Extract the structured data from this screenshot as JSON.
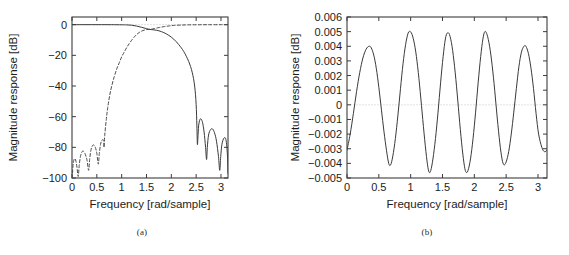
{
  "figure": {
    "panels": [
      {
        "id": "a",
        "caption": "(a)",
        "chart_data": {
          "type": "line",
          "title": "",
          "xlabel": "Frequency [rad/sample]",
          "ylabel": "Magnitude response [dB]",
          "xlim": [
            0,
            3.14159
          ],
          "ylim": [
            -100,
            5
          ],
          "xticks": [
            0,
            0.5,
            1,
            1.5,
            2,
            2.5,
            3
          ],
          "xticklabels": [
            "0",
            "0.5",
            "1",
            "1.5",
            "2",
            "2.5",
            "3"
          ],
          "yticks": [
            0,
            -20,
            -40,
            -60,
            -80,
            -100
          ],
          "yticklabels": [
            "0",
            "−20",
            "−40",
            "−60",
            "−80",
            "−100"
          ],
          "grid": false,
          "legend": "none",
          "reference_line": {
            "y": 0,
            "style": "dotted",
            "color": "#bfbfbf"
          },
          "series": [
            {
              "name": "lowpass-response",
              "style": "solid",
              "color": "#3a3a3a",
              "points": [
                [
                  0.0,
                  0.0
                ],
                [
                  0.2,
                  0.0
                ],
                [
                  0.4,
                  0.0
                ],
                [
                  0.6,
                  0.0
                ],
                [
                  0.8,
                  -0.02
                ],
                [
                  1.0,
                  -0.08
                ],
                [
                  1.1,
                  -0.15
                ],
                [
                  1.2,
                  -0.35
                ],
                [
                  1.3,
                  -0.9
                ],
                [
                  1.4,
                  -1.7
                ],
                [
                  1.5,
                  -2.6
                ],
                [
                  1.57,
                  -3.1
                ],
                [
                  1.65,
                  -3.4
                ],
                [
                  1.75,
                  -4.0
                ],
                [
                  1.85,
                  -5.2
                ],
                [
                  1.95,
                  -7.0
                ],
                [
                  2.05,
                  -9.5
                ],
                [
                  2.15,
                  -13.0
                ],
                [
                  2.25,
                  -17.5
                ],
                [
                  2.35,
                  -24.0
                ],
                [
                  2.42,
                  -31.0
                ],
                [
                  2.47,
                  -40.0
                ],
                [
                  2.5,
                  -52.0
                ],
                [
                  2.515,
                  -66.0
                ],
                [
                  2.525,
                  -78.0
                ],
                [
                  2.535,
                  -74.0
                ],
                [
                  2.55,
                  -66.0
                ],
                [
                  2.575,
                  -62.0
                ],
                [
                  2.6,
                  -61.5
                ],
                [
                  2.63,
                  -64.0
                ],
                [
                  2.66,
                  -70.0
                ],
                [
                  2.69,
                  -80.0
                ],
                [
                  2.71,
                  -88.0
                ],
                [
                  2.725,
                  -80.0
                ],
                [
                  2.75,
                  -72.0
                ],
                [
                  2.79,
                  -68.5
                ],
                [
                  2.83,
                  -68.0
                ],
                [
                  2.87,
                  -70.5
                ],
                [
                  2.91,
                  -76.0
                ],
                [
                  2.95,
                  -86.0
                ],
                [
                  2.975,
                  -95.0
                ],
                [
                  2.995,
                  -86.0
                ],
                [
                  3.02,
                  -78.0
                ],
                [
                  3.06,
                  -74.0
                ],
                [
                  3.1,
                  -75.0
                ],
                [
                  3.13,
                  -85.0
                ],
                [
                  3.1416,
                  -97.0
                ]
              ]
            },
            {
              "name": "highpass-response",
              "style": "dashed",
              "color": "#4a4a4a",
              "points": [
                [
                  0.005,
                  -100.0
                ],
                [
                  0.02,
                  -92.0
                ],
                [
                  0.04,
                  -88.0
                ],
                [
                  0.06,
                  -87.5
                ],
                [
                  0.08,
                  -89.0
                ],
                [
                  0.1,
                  -93.0
                ],
                [
                  0.125,
                  -99.0
                ],
                [
                  0.145,
                  -92.0
                ],
                [
                  0.17,
                  -86.0
                ],
                [
                  0.2,
                  -83.0
                ],
                [
                  0.23,
                  -82.5
                ],
                [
                  0.26,
                  -84.0
                ],
                [
                  0.3,
                  -88.0
                ],
                [
                  0.335,
                  -95.0
                ],
                [
                  0.355,
                  -88.0
                ],
                [
                  0.38,
                  -82.0
                ],
                [
                  0.41,
                  -79.0
                ],
                [
                  0.44,
                  -78.5
                ],
                [
                  0.47,
                  -80.0
                ],
                [
                  0.5,
                  -84.0
                ],
                [
                  0.53,
                  -91.0
                ],
                [
                  0.55,
                  -84.0
                ],
                [
                  0.575,
                  -78.0
                ],
                [
                  0.6,
                  -75.5
                ],
                [
                  0.625,
                  -75.0
                ],
                [
                  0.64,
                  -76.0
                ],
                [
                  0.645,
                  -80.0
                ],
                [
                  0.66,
                  -72.0
                ],
                [
                  0.69,
                  -62.0
                ],
                [
                  0.72,
                  -54.0
                ],
                [
                  0.76,
                  -46.0
                ],
                [
                  0.8,
                  -40.0
                ],
                [
                  0.85,
                  -34.0
                ],
                [
                  0.9,
                  -29.0
                ],
                [
                  0.95,
                  -25.0
                ],
                [
                  1.0,
                  -21.0
                ],
                [
                  1.05,
                  -18.0
                ],
                [
                  1.1,
                  -15.0
                ],
                [
                  1.15,
                  -12.5
                ],
                [
                  1.2,
                  -10.2
                ],
                [
                  1.25,
                  -8.2
                ],
                [
                  1.3,
                  -6.5
                ],
                [
                  1.35,
                  -5.2
                ],
                [
                  1.4,
                  -4.2
                ],
                [
                  1.45,
                  -3.6
                ],
                [
                  1.5,
                  -3.2
                ],
                [
                  1.57,
                  -3.05
                ],
                [
                  1.65,
                  -2.6
                ],
                [
                  1.75,
                  -1.9
                ],
                [
                  1.85,
                  -1.3
                ],
                [
                  1.95,
                  -0.85
                ],
                [
                  2.05,
                  -0.5
                ],
                [
                  2.2,
                  -0.25
                ],
                [
                  2.4,
                  -0.1
                ],
                [
                  2.6,
                  -0.04
                ],
                [
                  2.8,
                  -0.02
                ],
                [
                  3.0,
                  -0.01
                ],
                [
                  3.1416,
                  0.0
                ]
              ]
            }
          ]
        }
      },
      {
        "id": "b",
        "caption": "(b)",
        "chart_data": {
          "type": "line",
          "title": "",
          "xlabel": "Frequency [rad/sample]",
          "ylabel": "Magnitude response [dB]",
          "xlim": [
            0,
            3.14159
          ],
          "ylim": [
            -0.005,
            0.006
          ],
          "xticks": [
            0,
            0.5,
            1,
            1.5,
            2,
            2.5,
            3
          ],
          "xticklabels": [
            "0",
            "0.5",
            "1",
            "1.5",
            "2",
            "2.5",
            "3"
          ],
          "yticks": [
            0.006,
            0.005,
            0.004,
            0.003,
            0.002,
            0.001,
            0,
            -0.001,
            -0.002,
            -0.003,
            -0.004,
            -0.005
          ],
          "yticklabels": [
            "0.006",
            "0.005",
            "0.004",
            "0.003",
            "0.002",
            "0.001",
            "0",
            "−0.001",
            "−0.002",
            "−0.003",
            "−0.004",
            "−0.005"
          ],
          "grid": false,
          "legend": "none",
          "reference_line": {
            "y": 0,
            "style": "dotted",
            "color": "#c4c4c4"
          },
          "series": [
            {
              "name": "passband-ripple",
              "style": "solid",
              "color": "#3a3a3a",
              "points": [
                [
                  0.0,
                  -0.0031
                ],
                [
                  0.05,
                  -0.002
                ],
                [
                  0.1,
                  -0.0006
                ],
                [
                  0.15,
                  0.0009
                ],
                [
                  0.2,
                  0.0022
                ],
                [
                  0.25,
                  0.0032
                ],
                [
                  0.3,
                  0.0038
                ],
                [
                  0.345,
                  0.004
                ],
                [
                  0.38,
                  0.0039
                ],
                [
                  0.42,
                  0.0034
                ],
                [
                  0.46,
                  0.0025
                ],
                [
                  0.5,
                  0.0012
                ],
                [
                  0.54,
                  -0.0003
                ],
                [
                  0.58,
                  -0.0018
                ],
                [
                  0.62,
                  -0.0031
                ],
                [
                  0.655,
                  -0.004
                ],
                [
                  0.685,
                  -0.0041
                ],
                [
                  0.72,
                  -0.0035
                ],
                [
                  0.76,
                  -0.0023
                ],
                [
                  0.8,
                  -0.0007
                ],
                [
                  0.84,
                  0.0011
                ],
                [
                  0.88,
                  0.0028
                ],
                [
                  0.92,
                  0.0041
                ],
                [
                  0.96,
                  0.0049
                ],
                [
                  0.995,
                  0.005
                ],
                [
                  1.03,
                  0.0047
                ],
                [
                  1.07,
                  0.0039
                ],
                [
                  1.11,
                  0.0026
                ],
                [
                  1.15,
                  0.0009
                ],
                [
                  1.19,
                  -0.001
                ],
                [
                  1.23,
                  -0.0028
                ],
                [
                  1.265,
                  -0.0041
                ],
                [
                  1.29,
                  -0.0046
                ],
                [
                  1.315,
                  -0.0045
                ],
                [
                  1.35,
                  -0.0037
                ],
                [
                  1.39,
                  -0.0023
                ],
                [
                  1.43,
                  -0.0005
                ],
                [
                  1.47,
                  0.0015
                ],
                [
                  1.51,
                  0.0033
                ],
                [
                  1.545,
                  0.0045
                ],
                [
                  1.575,
                  0.0049
                ],
                [
                  1.61,
                  0.0048
                ],
                [
                  1.65,
                  0.004
                ],
                [
                  1.69,
                  0.0026
                ],
                [
                  1.73,
                  0.0008
                ],
                [
                  1.77,
                  -0.0012
                ],
                [
                  1.81,
                  -0.003
                ],
                [
                  1.845,
                  -0.0042
                ],
                [
                  1.87,
                  -0.0046
                ],
                [
                  1.9,
                  -0.0045
                ],
                [
                  1.94,
                  -0.0037
                ],
                [
                  1.98,
                  -0.0023
                ],
                [
                  2.02,
                  -0.0005
                ],
                [
                  2.06,
                  0.0015
                ],
                [
                  2.1,
                  0.0033
                ],
                [
                  2.135,
                  0.0045
                ],
                [
                  2.165,
                  0.005
                ],
                [
                  2.2,
                  0.0048
                ],
                [
                  2.24,
                  0.004
                ],
                [
                  2.28,
                  0.0027
                ],
                [
                  2.32,
                  0.001
                ],
                [
                  2.36,
                  -0.0009
                ],
                [
                  2.4,
                  -0.0026
                ],
                [
                  2.435,
                  -0.0037
                ],
                [
                  2.465,
                  -0.0041
                ],
                [
                  2.5,
                  -0.0039
                ],
                [
                  2.54,
                  -0.0032
                ],
                [
                  2.58,
                  -0.002
                ],
                [
                  2.62,
                  -0.0005
                ],
                [
                  2.66,
                  0.0011
                ],
                [
                  2.7,
                  0.0026
                ],
                [
                  2.74,
                  0.0036
                ],
                [
                  2.78,
                  0.004
                ],
                [
                  2.81,
                  0.004
                ],
                [
                  2.85,
                  0.0035
                ],
                [
                  2.89,
                  0.0025
                ],
                [
                  2.93,
                  0.0011
                ],
                [
                  2.97,
                  -0.0006
                ],
                [
                  3.01,
                  -0.002
                ],
                [
                  3.06,
                  -0.0029
                ],
                [
                  3.1,
                  -0.0032
                ],
                [
                  3.1416,
                  -0.0031
                ]
              ]
            }
          ]
        }
      }
    ]
  }
}
